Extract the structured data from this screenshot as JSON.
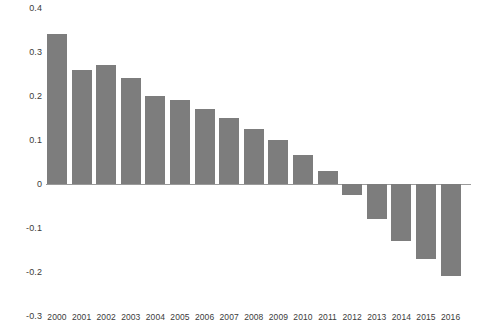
{
  "chart_data": {
    "type": "bar",
    "title": "",
    "subtitle": "",
    "xlabel": "",
    "ylabel": "",
    "grid": false,
    "legend": null,
    "bar_color": "#7d7d7d",
    "zero_line_color": "#9a9a9a",
    "ylim": [
      -0.3,
      0.4
    ],
    "ytick_labels": [
      "0.4",
      "0.3",
      "0.2",
      "0.1",
      "0",
      "-0.1",
      "-0.2",
      "-0.3"
    ],
    "ytick_values": [
      0.4,
      0.3,
      0.2,
      0.1,
      0,
      -0.1,
      -0.2,
      -0.3
    ],
    "categories": [
      "2000",
      "2001",
      "2002",
      "2003",
      "2004",
      "2005",
      "2006",
      "2007",
      "2008",
      "2009",
      "2010",
      "2011",
      "2012",
      "2013",
      "2014",
      "2015",
      "2016"
    ],
    "values": [
      0.34,
      0.26,
      0.27,
      0.24,
      0.2,
      0.19,
      0.17,
      0.15,
      0.125,
      0.1,
      0.065,
      0.03,
      -0.025,
      -0.08,
      -0.13,
      -0.17,
      -0.21
    ]
  }
}
